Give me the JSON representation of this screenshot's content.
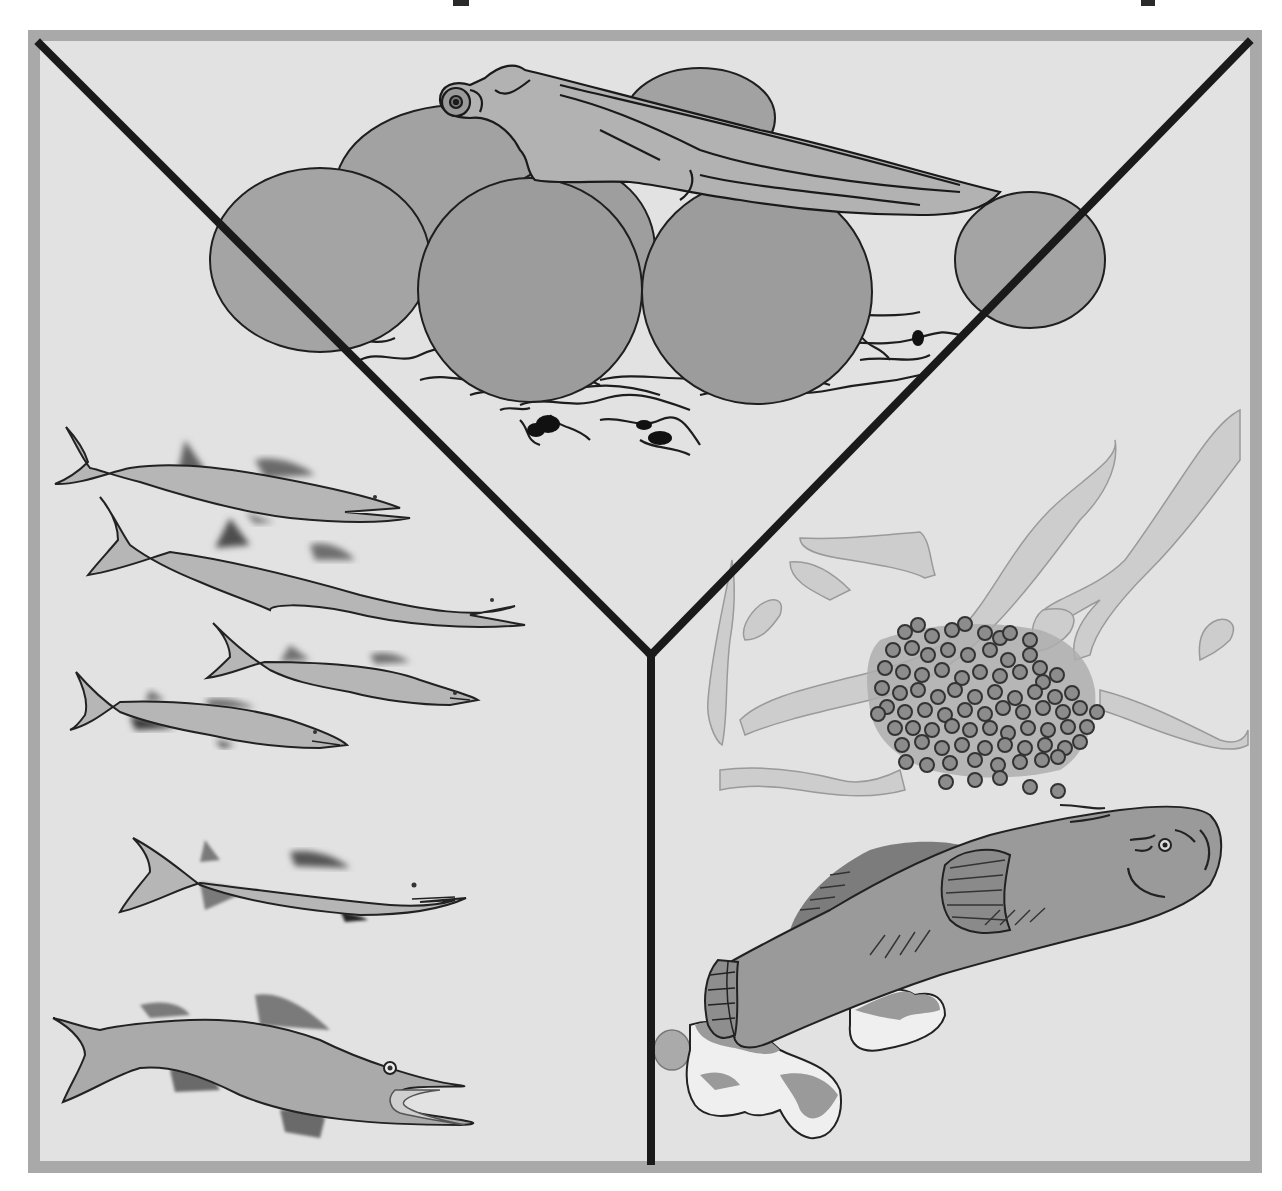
{
  "figure": {
    "colors": {
      "page_background": "#ffffff",
      "frame_border": "#a9a9a9",
      "panel_background": "#e2e2e2",
      "divider": "#1a1a1a",
      "egg_fill": "#9a9a9a",
      "fish_fill": "#b4b4b4",
      "fin_dark": "#5a5a5a",
      "seaweed_fill": "#cfcfcf",
      "outline": "#222222"
    },
    "panels": [
      {
        "id": "top",
        "label": "Larva hatching on egg cluster attached to substrate"
      },
      {
        "id": "left",
        "label": "School of juvenile elongated fish and an adult predatory fish"
      },
      {
        "id": "right",
        "label": "Egg mass among seaweed with a bottom-dwelling adult fish and rocks"
      }
    ],
    "counts": {
      "large_eggs": 7,
      "juvenile_fish": 5,
      "adult_fish_left": 1,
      "small_eggs_in_mass": 100
    }
  }
}
